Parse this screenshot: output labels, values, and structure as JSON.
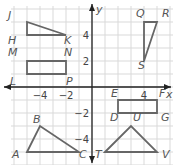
{
  "plane": {
    "origin_px": [
      92,
      87
    ],
    "unit_px": 13,
    "x_range": [
      -6,
      6
    ],
    "y_range": [
      -6,
      6
    ],
    "axis_labels": {
      "x": "x",
      "y": "y"
    },
    "x_ticks": [
      {
        "value": -4,
        "label": "−4"
      },
      {
        "value": -2,
        "label": "−2"
      },
      {
        "value": 4,
        "label": "4"
      }
    ],
    "y_ticks": [
      {
        "value": 4,
        "label": "4"
      },
      {
        "value": 2,
        "label": "2"
      },
      {
        "value": -2,
        "label": "−2"
      },
      {
        "value": -4,
        "label": "−4"
      }
    ],
    "grid_color": "#d9d9d9",
    "axis_color": "#222222",
    "shape_color": "#666666"
  },
  "shapes": [
    {
      "name": "triangle-JHK",
      "points": [
        [
          "J",
          -5,
          5
        ],
        [
          "H",
          -5,
          4
        ],
        [
          "K",
          -2,
          4
        ]
      ]
    },
    {
      "name": "rectangle-LMNP",
      "points": [
        [
          "M",
          -5,
          2
        ],
        [
          "N",
          -2,
          2
        ],
        [
          "P",
          -2,
          1
        ],
        [
          "L",
          -5,
          1
        ]
      ]
    },
    {
      "name": "triangle-QRS",
      "points": [
        [
          "Q",
          4,
          5
        ],
        [
          "R",
          5,
          5
        ],
        [
          "S",
          4,
          2
        ]
      ]
    },
    {
      "name": "rectangle-EFGD",
      "points": [
        [
          "E",
          2,
          -1
        ],
        [
          "F",
          5,
          -1
        ],
        [
          "G",
          5,
          -2
        ],
        [
          "D",
          2,
          -2
        ]
      ]
    },
    {
      "name": "triangle-ABC",
      "points": [
        [
          "A",
          -5,
          -5
        ],
        [
          "B",
          -4,
          -3
        ],
        [
          "C",
          -1,
          -5
        ]
      ]
    },
    {
      "name": "triangle-TUV",
      "points": [
        [
          "T",
          1,
          -5
        ],
        [
          "U",
          3,
          -3
        ],
        [
          "V",
          5,
          -5
        ]
      ]
    }
  ],
  "labels": [
    {
      "text": "J",
      "x": 8,
      "y": 19
    },
    {
      "text": "H",
      "x": 8,
      "y": 44
    },
    {
      "text": "K",
      "x": 64,
      "y": 44
    },
    {
      "text": "M",
      "x": 8,
      "y": 56
    },
    {
      "text": "N",
      "x": 64,
      "y": 56
    },
    {
      "text": "L",
      "x": 10,
      "y": 85
    },
    {
      "text": "P",
      "x": 66,
      "y": 85
    },
    {
      "text": "Q",
      "x": 136,
      "y": 17
    },
    {
      "text": "R",
      "x": 162,
      "y": 17
    },
    {
      "text": "S",
      "x": 138,
      "y": 69
    },
    {
      "text": "E",
      "x": 111,
      "y": 97
    },
    {
      "text": "F",
      "x": 159,
      "y": 97
    },
    {
      "text": "D",
      "x": 110,
      "y": 121
    },
    {
      "text": "U",
      "x": 133,
      "y": 121
    },
    {
      "text": "G",
      "x": 161,
      "y": 121
    },
    {
      "text": "A",
      "x": 12,
      "y": 158
    },
    {
      "text": "B",
      "x": 33,
      "y": 123
    },
    {
      "text": "C",
      "x": 79,
      "y": 158
    },
    {
      "text": "T",
      "x": 95,
      "y": 158
    },
    {
      "text": "V",
      "x": 162,
      "y": 158
    }
  ]
}
